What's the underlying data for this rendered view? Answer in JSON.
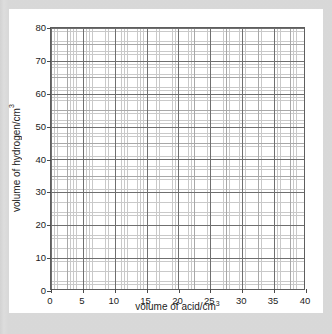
{
  "chart_data": {
    "type": "line",
    "title": "",
    "subtitle": "",
    "xlabel_text": "volume of acid/cm",
    "xlabel_sup": "3",
    "ylabel_text": "volume of hydrogen/cm",
    "ylabel_sup": "3",
    "xlim": [
      0,
      40
    ],
    "ylim": [
      0,
      80
    ],
    "x_major_step": 5,
    "y_major_step": 10,
    "x_tick_labels": [
      "0",
      "5",
      "10",
      "15",
      "20",
      "25",
      "30",
      "35",
      "40"
    ],
    "x_tick_values": [
      0,
      5,
      10,
      15,
      20,
      25,
      30,
      35,
      40
    ],
    "y_tick_labels": [
      "0",
      "10",
      "20",
      "30",
      "40",
      "50",
      "60",
      "70",
      "80"
    ],
    "y_tick_values": [
      0,
      10,
      20,
      30,
      40,
      50,
      60,
      70,
      80
    ],
    "grid": true,
    "grid_style": "graph-paper",
    "minor_divisions_per_major_x": 10,
    "minor_divisions_per_major_y": 10,
    "legend": null,
    "legend_position": "none",
    "series": [],
    "annotations": []
  },
  "style": {
    "page_border_color": "#d7d7d7",
    "card_background": "#ffffff",
    "plot_border_color": "#5e5e5e",
    "grid_minor_color": "#c9c9c9",
    "grid_medium_color": "#a8a8a8",
    "grid_major_color": "#6f6f6f",
    "text_color": "#1c1c1c"
  }
}
